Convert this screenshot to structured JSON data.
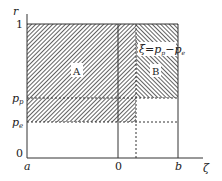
{
  "diagram": {
    "axes": {
      "y_axis_label": "r",
      "x_axis_label": "ζ",
      "y_ticks": [
        {
          "label": "1",
          "value": 1
        },
        {
          "label": "p",
          "sub": "p",
          "value": "p_p"
        },
        {
          "label": "p",
          "sub": "e",
          "value": "p_e"
        },
        {
          "label": "0",
          "value": 0
        }
      ],
      "x_ticks": [
        {
          "label": "a"
        },
        {
          "label": "0"
        },
        {
          "label": "b"
        }
      ]
    },
    "regions": [
      {
        "id": "A",
        "label": "A",
        "fill": "hatched-diagonal-right"
      },
      {
        "id": "B",
        "label": "B",
        "fill": "hatched-diagonal-left"
      }
    ],
    "annotation": {
      "text_xi": "ξ",
      "text_eq": "=",
      "p1": "p",
      "p1_sub": "p",
      "minus": "−",
      "p2": "p",
      "p2_sub": "e"
    },
    "colors": {
      "line": "#333333",
      "hatch": "#444444",
      "background": "#ffffff"
    }
  }
}
